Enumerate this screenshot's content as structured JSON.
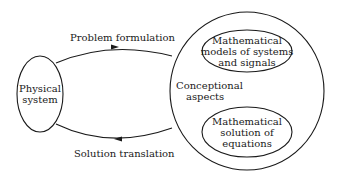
{
  "diagram": {
    "nodes": {
      "physical_system": {
        "line1": "Physical",
        "line2": "system"
      },
      "conceptional": {
        "line1": "Conceptional",
        "line2": "aspects"
      },
      "math_models": {
        "line1": "Mathematical",
        "line2": "models of systems",
        "line3": "and signals"
      },
      "math_solution": {
        "line1": "Mathematical",
        "line2": "solution of",
        "line3": "equations"
      }
    },
    "edges": {
      "top": {
        "label": "Problem formulation",
        "from": "Physical system",
        "to": "Conceptional aspects"
      },
      "bottom": {
        "label": "Solution translation",
        "from": "Conceptional aspects",
        "to": "Physical system"
      }
    },
    "colors": {
      "stroke": "#1a1a1a",
      "background": "#ffffff"
    }
  }
}
